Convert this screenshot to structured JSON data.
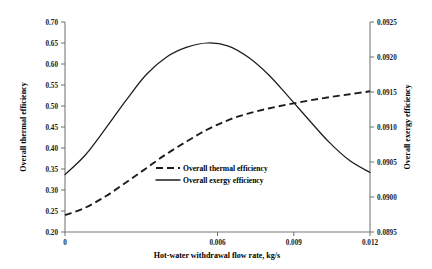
{
  "chart_data": {
    "type": "line",
    "title": "",
    "xlabel": "Hot-water withdrawal flow rate, kg/s",
    "ylabel": "Overall thermal efficiency",
    "y2label": "Overall exergy efficiency",
    "xlim": [
      0,
      0.012
    ],
    "ylim": [
      0.2,
      0.7
    ],
    "y2lim": [
      0.0895,
      0.0925
    ],
    "grid": false,
    "legend_position": "center",
    "xticks": [
      "0",
      "0.006",
      "0.009",
      "0.012"
    ],
    "xtick_values": [
      0,
      0.006,
      0.009,
      0.012
    ],
    "yticks": [
      "0.20",
      "0.25",
      "0.30",
      "0.35",
      "0.40",
      "0.45",
      "0.50",
      "0.55",
      "0.60",
      "0.65",
      "0.70"
    ],
    "ytick_values": [
      0.2,
      0.25,
      0.3,
      0.35,
      0.4,
      0.45,
      0.5,
      0.55,
      0.6,
      0.65,
      0.7
    ],
    "y2ticks": [
      "0.0895",
      "0.0900",
      "0.0905",
      "0.0910",
      "0.0915",
      "0.0920",
      "0.0925"
    ],
    "y2tick_values": [
      0.0895,
      0.09,
      0.0905,
      0.091,
      0.0915,
      0.092,
      0.0925
    ],
    "series": [
      {
        "name": "Overall thermal efficiency",
        "style": "dashed",
        "axis": "left",
        "color": "#1c1c1c",
        "x": [
          0,
          0.0008,
          0.0016,
          0.0024,
          0.0032,
          0.004,
          0.0048,
          0.0056,
          0.0064,
          0.0072,
          0.008,
          0.0088,
          0.0096,
          0.0104,
          0.0112,
          0.012
        ],
        "values": [
          0.24,
          0.258,
          0.285,
          0.318,
          0.352,
          0.386,
          0.416,
          0.444,
          0.466,
          0.482,
          0.494,
          0.504,
          0.513,
          0.521,
          0.528,
          0.535
        ]
      },
      {
        "name": "Overall exergy efficiency",
        "style": "solid",
        "axis": "right",
        "color": "#1c1c1c",
        "x": [
          0,
          0.0008,
          0.0016,
          0.0024,
          0.0032,
          0.004,
          0.0048,
          0.0056,
          0.0064,
          0.0072,
          0.008,
          0.0088,
          0.0096,
          0.0104,
          0.0112,
          0.012
        ],
        "values": [
          0.09032,
          0.0906,
          0.09098,
          0.09138,
          0.09175,
          0.092,
          0.09214,
          0.0922,
          0.09216,
          0.092,
          0.09175,
          0.09143,
          0.0911,
          0.09078,
          0.09052,
          0.09035
        ]
      }
    ],
    "annotations": {
      "peak_exergy_x": 0.0058,
      "peak_exergy_value": 0.0922,
      "crossover_x": 0.0085
    }
  },
  "legend": {
    "items": [
      {
        "label": "Overall thermal efficiency",
        "style": "dashed"
      },
      {
        "label": "Overall exergy efficiency",
        "style": "solid"
      }
    ]
  }
}
